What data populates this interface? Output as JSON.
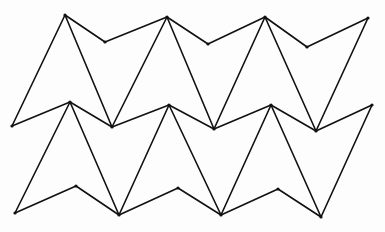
{
  "diagram": {
    "type": "tessellation-line-drawing",
    "stroke_color": "#111111",
    "background_color": "#fdfdfd",
    "stroke_width": 1.6,
    "vertex_radius": 1.6,
    "vertices": {
      "a1": [
        12,
        126
      ],
      "a2": [
        65,
        15
      ],
      "a3": [
        105,
        42
      ],
      "a4": [
        167,
        17
      ],
      "a5": [
        208,
        44
      ],
      "a6": [
        265,
        17
      ],
      "a7": [
        307,
        47
      ],
      "a8": [
        368,
        18
      ],
      "b1": [
        70,
        102
      ],
      "b2": [
        112,
        127
      ],
      "b3": [
        169,
        105
      ],
      "b4": [
        214,
        129
      ],
      "b5": [
        271,
        105
      ],
      "b6": [
        316,
        131
      ],
      "b7": [
        372,
        105
      ],
      "c1": [
        15,
        213
      ],
      "c2": [
        76,
        186
      ],
      "c3": [
        119,
        215
      ],
      "c4": [
        178,
        188
      ],
      "c5": [
        221,
        215
      ],
      "c6": [
        278,
        189
      ],
      "c7": [
        321,
        217
      ]
    },
    "edges": [
      [
        "a1",
        "a2"
      ],
      [
        "a2",
        "a3"
      ],
      [
        "a3",
        "a4"
      ],
      [
        "a4",
        "a5"
      ],
      [
        "a5",
        "a6"
      ],
      [
        "a6",
        "a7"
      ],
      [
        "a7",
        "a8"
      ],
      [
        "a2",
        "b2"
      ],
      [
        "a4",
        "b2"
      ],
      [
        "a4",
        "b4"
      ],
      [
        "a6",
        "b4"
      ],
      [
        "a6",
        "b6"
      ],
      [
        "a8",
        "b6"
      ],
      [
        "a1",
        "b1"
      ],
      [
        "b1",
        "b2"
      ],
      [
        "b2",
        "b3"
      ],
      [
        "b3",
        "b4"
      ],
      [
        "b4",
        "b5"
      ],
      [
        "b5",
        "b6"
      ],
      [
        "b6",
        "b7"
      ],
      [
        "b1",
        "c1"
      ],
      [
        "b1",
        "c3"
      ],
      [
        "b3",
        "c3"
      ],
      [
        "b3",
        "c5"
      ],
      [
        "b5",
        "c5"
      ],
      [
        "b5",
        "c7"
      ],
      [
        "b7",
        "c7"
      ],
      [
        "c1",
        "c2"
      ],
      [
        "c2",
        "c3"
      ],
      [
        "c3",
        "c4"
      ],
      [
        "c4",
        "c5"
      ],
      [
        "c5",
        "c6"
      ],
      [
        "c6",
        "c7"
      ]
    ]
  }
}
